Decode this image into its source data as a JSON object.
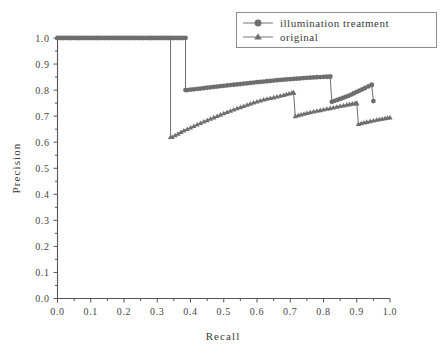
{
  "chart_data": {
    "type": "line",
    "title": "",
    "xlabel": "Recall",
    "ylabel": "Precision",
    "xlim": [
      0.0,
      1.0
    ],
    "ylim": [
      0.0,
      1.0
    ],
    "grid": false,
    "legend_position": "top-right",
    "xticks": [
      "0.0",
      "0.1",
      "0.2",
      "0.3",
      "0.4",
      "0.5",
      "0.6",
      "0.7",
      "0.8",
      "0.9",
      "1.0"
    ],
    "yticks": [
      "0.0",
      "0.1",
      "0.2",
      "0.3",
      "0.4",
      "0.5",
      "0.6",
      "0.7",
      "0.8",
      "0.9",
      "1.0"
    ],
    "xtick_values": [
      0.0,
      0.1,
      0.2,
      0.3,
      0.4,
      0.5,
      0.6,
      0.7,
      0.8,
      0.9,
      1.0
    ],
    "ytick_values": [
      0.0,
      0.1,
      0.2,
      0.3,
      0.4,
      0.5,
      0.6,
      0.7,
      0.8,
      0.9,
      1.0
    ],
    "series": [
      {
        "name": "illumination treatment",
        "marker": "circle",
        "color": "#6e6e6e",
        "x": [
          0.0,
          0.05,
          0.1,
          0.15,
          0.2,
          0.25,
          0.3,
          0.35,
          0.385,
          0.385,
          0.39,
          0.43,
          0.47,
          0.51,
          0.55,
          0.59,
          0.63,
          0.67,
          0.71,
          0.75,
          0.79,
          0.82,
          0.82,
          0.825,
          0.85,
          0.875,
          0.9,
          0.925,
          0.945,
          0.945,
          0.95
        ],
        "y": [
          1.0,
          1.0,
          1.0,
          1.0,
          1.0,
          1.0,
          1.0,
          1.0,
          1.0,
          0.8,
          0.8,
          0.806,
          0.812,
          0.818,
          0.823,
          0.829,
          0.834,
          0.839,
          0.843,
          0.847,
          0.85,
          0.852,
          0.852,
          0.755,
          0.766,
          0.778,
          0.793,
          0.808,
          0.82,
          0.82,
          0.758
        ]
      },
      {
        "name": "original",
        "marker": "triangle",
        "color": "#6e6e6e",
        "x": [
          0.0,
          0.05,
          0.1,
          0.15,
          0.2,
          0.25,
          0.3,
          0.34,
          0.34,
          0.345,
          0.38,
          0.42,
          0.46,
          0.5,
          0.54,
          0.58,
          0.62,
          0.65,
          0.68,
          0.705,
          0.71,
          0.71,
          0.715,
          0.75,
          0.79,
          0.83,
          0.87,
          0.895,
          0.9,
          0.9,
          0.905,
          0.93,
          0.96,
          0.985,
          1.0
        ],
        "y": [
          1.0,
          1.0,
          1.0,
          1.0,
          1.0,
          1.0,
          1.0,
          1.0,
          0.62,
          0.62,
          0.645,
          0.668,
          0.69,
          0.711,
          0.73,
          0.748,
          0.764,
          0.772,
          0.781,
          0.79,
          0.79,
          0.79,
          0.7,
          0.712,
          0.723,
          0.733,
          0.744,
          0.75,
          0.75,
          0.75,
          0.67,
          0.678,
          0.686,
          0.692,
          0.695
        ]
      }
    ]
  },
  "legend": {
    "entries": [
      {
        "label": "illumination treatment",
        "marker": "circle-marker",
        "color": "#6e6e6e"
      },
      {
        "label": "original",
        "marker": "triangle-marker",
        "color": "#6e6e6e"
      }
    ]
  },
  "axes": {
    "x_title": "Recall",
    "y_title": "Precision"
  }
}
